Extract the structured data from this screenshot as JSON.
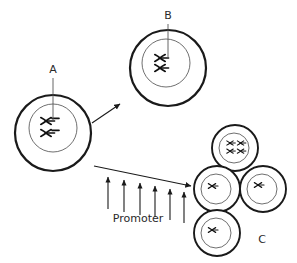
{
  "figure": {
    "kind": "biology-cell-division-diagram",
    "background_color": "#ffffff",
    "line_color": "#1a1a1a",
    "nucleus_line_color": "#4a4a4a",
    "text_color": "#2a2a2a",
    "width": 297,
    "height": 263
  },
  "labels": {
    "a": "A",
    "b": "B",
    "c": "C",
    "promoter": "Promoter"
  },
  "cells": [
    {
      "id": "cell-a",
      "label": "A",
      "role": "parent-cell",
      "cx": 53,
      "cy": 133,
      "membrane_r": 38,
      "membrane_stroke": 2.2,
      "nucleus_r": 24,
      "chromosome_count": 4,
      "chromosome_scale": 1.0
    },
    {
      "id": "cell-b",
      "label": "B",
      "role": "enlarged-cell",
      "cx": 168,
      "cy": 68,
      "membrane_r": 38,
      "membrane_stroke": 2.2,
      "nucleus_r": 24,
      "chromosome_count": 2,
      "chromosome_scale": 1.0
    },
    {
      "id": "cell-c-top",
      "label": "C",
      "role": "daughter-cell",
      "cx": 235,
      "cy": 148,
      "membrane_r": 23,
      "membrane_stroke": 1.8,
      "nucleus_r": 15,
      "chromosome_count": 2,
      "chromosome_scale": 0.62
    },
    {
      "id": "cell-c-left",
      "label": "C",
      "role": "daughter-cell",
      "cx": 217,
      "cy": 189,
      "membrane_r": 23,
      "membrane_stroke": 1.8,
      "nucleus_r": 15,
      "chromosome_count": 1,
      "chromosome_scale": 0.62
    },
    {
      "id": "cell-c-right",
      "label": "C",
      "role": "daughter-cell",
      "cx": 263,
      "cy": 189,
      "membrane_r": 23,
      "membrane_stroke": 1.8,
      "nucleus_r": 15,
      "chromosome_count": 1,
      "chromosome_scale": 0.62
    },
    {
      "id": "cell-c-bottom",
      "label": "C",
      "role": "daughter-cell",
      "cx": 217,
      "cy": 233,
      "membrane_r": 23,
      "membrane_stroke": 1.8,
      "nucleus_r": 15,
      "chromosome_count": 1,
      "chromosome_scale": 0.62
    }
  ],
  "leaders": [
    {
      "id": "leader-a",
      "label": "A",
      "x": 53,
      "y_top": 78,
      "y_bottom": 120,
      "text_x": 53,
      "text_y": 72
    },
    {
      "id": "leader-b",
      "label": "B",
      "x": 168,
      "y_top": 24,
      "y_bottom": 58,
      "text_x": 168,
      "text_y": 18
    }
  ],
  "flow_arrows": [
    {
      "id": "arrow-a-to-b",
      "x1": 93,
      "y1": 122,
      "x2": 122,
      "y2": 104
    },
    {
      "id": "arrow-a-to-c",
      "x1": 93,
      "y1": 165,
      "x2": 190,
      "y2": 185
    }
  ],
  "promoter_arrows": {
    "count": 6,
    "label": "Promoter",
    "label_x": 138,
    "label_y": 220,
    "arrows": [
      {
        "x": 108,
        "y_base": 208,
        "y_tip": 178
      },
      {
        "x": 124,
        "y_base": 211,
        "y_tip": 181
      },
      {
        "x": 140,
        "y_base": 214,
        "y_tip": 184
      },
      {
        "x": 155,
        "y_base": 216,
        "y_tip": 187
      },
      {
        "x": 170,
        "y_base": 219,
        "y_tip": 190
      },
      {
        "x": 184,
        "y_base": 222,
        "y_tip": 193
      }
    ]
  },
  "c_label": {
    "x": 262,
    "y": 240,
    "text": "C"
  }
}
